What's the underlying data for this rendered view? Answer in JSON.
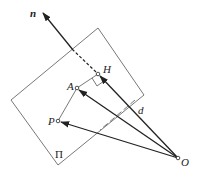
{
  "diagram": {
    "title": "",
    "labels": {
      "normal": "n",
      "foot": "H",
      "point_a": "A",
      "point_p": "P",
      "origin": "O",
      "distance": "d",
      "plane": "Π"
    },
    "colors": {
      "stroke": "#222222",
      "plane": "#555555",
      "background": "#ffffff"
    },
    "points": {
      "O": [
        178,
        158
      ],
      "H": [
        98,
        74
      ],
      "A": [
        77,
        88
      ],
      "P": [
        58,
        121
      ],
      "n_tip": [
        42,
        12
      ]
    },
    "plane_corners": [
      [
        98,
        28
      ],
      [
        144,
        95
      ],
      [
        58,
        165
      ],
      [
        11,
        100
      ]
    ]
  }
}
